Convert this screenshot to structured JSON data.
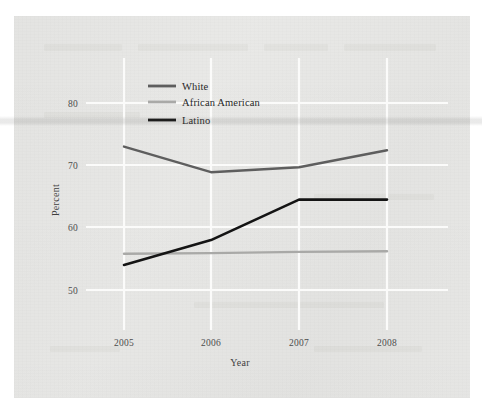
{
  "figure": {
    "background_color": "#e8e8e6",
    "page_color": "#ffffff",
    "gridline_color": "#fbfbfa",
    "scan_artifact": "horizontal-band"
  },
  "axes": {
    "y_title": "Percent",
    "x_title": "Year",
    "y_ticks": [
      "80",
      "70",
      "60",
      "50"
    ],
    "x_ticks": [
      "2005",
      "2006",
      "2007",
      "2008"
    ]
  },
  "legend": {
    "position": "top-left-inside",
    "items": [
      {
        "label": "White",
        "color": "#5e5e5e"
      },
      {
        "label": "African American",
        "color": "#a9a9a7"
      },
      {
        "label": "Latino",
        "color": "#141414"
      }
    ]
  },
  "chart_data": {
    "type": "line",
    "title": "",
    "xlabel": "Year",
    "ylabel": "Percent",
    "x": [
      "2005",
      "2006",
      "2007",
      "2008"
    ],
    "xlim": [
      "2005",
      "2008"
    ],
    "ylim": [
      46,
      84
    ],
    "yticks": [
      50,
      60,
      70,
      80
    ],
    "grid": true,
    "legend_position": "top-left-inside",
    "series": [
      {
        "name": "White",
        "color": "#5e5e5e",
        "linewidth": 2.4,
        "values": [
          73.0,
          68.9,
          69.7,
          72.4
        ]
      },
      {
        "name": "African American",
        "color": "#a9a9a7",
        "linewidth": 2.4,
        "values": [
          55.8,
          55.9,
          56.1,
          56.2
        ]
      },
      {
        "name": "Latino",
        "color": "#141414",
        "linewidth": 2.6,
        "values": [
          54.0,
          58.0,
          64.5,
          64.5
        ]
      }
    ]
  }
}
